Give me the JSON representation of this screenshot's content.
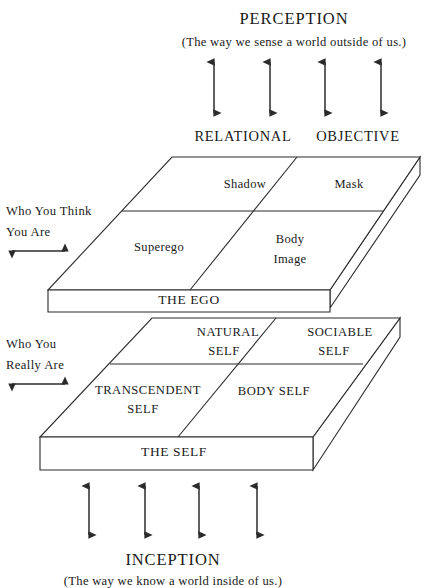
{
  "diagram": {
    "title_top": "PERCEPTION",
    "subtitle_top": "(The way we sense a world outside of us.)",
    "title_bottom": "INCEPTION",
    "subtitle_bottom": "(The way we know a world inside of us.)",
    "column_headers": [
      {
        "label": "RELATIONAL"
      },
      {
        "label": "OBJECTIVE"
      }
    ],
    "side_labels": [
      {
        "line1": "Who You Think",
        "line2": "You Are"
      },
      {
        "line1": "Who You",
        "line2": "Really Are"
      }
    ],
    "upper_plane": {
      "base_label": "THE EGO",
      "quadrants": [
        {
          "name": "shadow",
          "line1": "Shadow",
          "line2": ""
        },
        {
          "name": "mask",
          "line1": "Mask",
          "line2": ""
        },
        {
          "name": "superego",
          "line1": "Superego",
          "line2": ""
        },
        {
          "name": "body-image",
          "line1": "Body",
          "line2": "Image"
        }
      ]
    },
    "lower_plane": {
      "base_label": "THE SELF",
      "quadrants": [
        {
          "name": "natural-self",
          "line1": "NATURAL",
          "line2": "SELF"
        },
        {
          "name": "sociable-self",
          "line1": "SOCIABLE",
          "line2": "SELF"
        },
        {
          "name": "transcendent-self",
          "line1": "TRANSCENDENT",
          "line2": "SELF"
        },
        {
          "name": "body-self",
          "line1": "BODY SELF",
          "line2": ""
        }
      ]
    },
    "colors": {
      "ink": "#1a1a1a",
      "stroke": "#2b2b2b",
      "background": "#ffffff"
    }
  }
}
